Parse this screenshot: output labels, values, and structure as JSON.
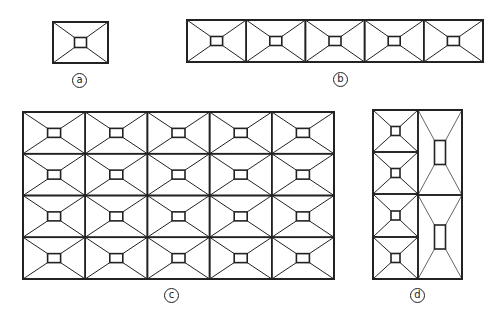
{
  "figure": {
    "stroke_color": "#222222",
    "background": "#ffffff"
  },
  "panels": [
    {
      "id": "a",
      "label": "a",
      "x": 53,
      "y": 22,
      "width": 55,
      "height": 41,
      "layout": [
        {
          "col": 0,
          "row": 0,
          "cols": 1,
          "rows": 1
        }
      ],
      "grid_cols": 1,
      "grid_rows": 1,
      "inner": {
        "w": 12,
        "h": 10
      },
      "label_pos": {
        "x": 72,
        "y": 73
      }
    },
    {
      "id": "b",
      "label": "b",
      "x": 187,
      "y": 20,
      "width": 296,
      "height": 42,
      "grid_cols": 5,
      "grid_rows": 1,
      "inner": {
        "w": 12,
        "h": 9
      },
      "label_pos": {
        "x": 333,
        "y": 72
      }
    },
    {
      "id": "c",
      "label": "c",
      "x": 23,
      "y": 112,
      "width": 311,
      "height": 167,
      "grid_cols": 5,
      "grid_rows": 4,
      "inner": {
        "w": 13,
        "h": 9
      },
      "label_pos": {
        "x": 164,
        "y": 288
      }
    },
    {
      "id": "d",
      "label": "d",
      "x": 373,
      "y": 110,
      "width": 89,
      "height": 169,
      "cells": [
        {
          "x": 373,
          "y": 110,
          "w": 45,
          "h": 42,
          "iw": 9,
          "ih": 9,
          "thin": false
        },
        {
          "x": 373,
          "y": 152,
          "w": 45,
          "h": 42,
          "iw": 9,
          "ih": 9,
          "thin": false
        },
        {
          "x": 373,
          "y": 194,
          "w": 45,
          "h": 43,
          "iw": 9,
          "ih": 9,
          "thin": false
        },
        {
          "x": 373,
          "y": 237,
          "w": 45,
          "h": 42,
          "iw": 9,
          "ih": 9,
          "thin": false
        },
        {
          "x": 418,
          "y": 110,
          "w": 44,
          "h": 85,
          "iw": 11,
          "ih": 24,
          "thin": true
        },
        {
          "x": 418,
          "y": 195,
          "w": 44,
          "h": 84,
          "iw": 11,
          "ih": 24,
          "thin": true
        }
      ],
      "label_pos": {
        "x": 410,
        "y": 288
      }
    }
  ]
}
